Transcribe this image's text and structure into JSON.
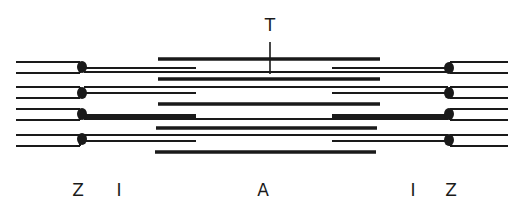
{
  "diagram": {
    "colors": {
      "line": "#1a1a1a",
      "background": "#ffffff"
    },
    "labels": {
      "top_marker": "T",
      "bottom": [
        {
          "id": "z-left",
          "text": "Z",
          "x": 78
        },
        {
          "id": "i-left",
          "text": "I",
          "x": 119
        },
        {
          "id": "a-band",
          "text": "A",
          "x": 263
        },
        {
          "id": "i-right",
          "text": "I",
          "x": 413
        },
        {
          "id": "z-right",
          "text": "Z",
          "x": 451
        }
      ]
    },
    "thick_filaments": [
      {
        "x1": 158,
        "x2": 380,
        "y": 59
      },
      {
        "x1": 158,
        "x2": 380,
        "y": 79
      },
      {
        "x1": 158,
        "x2": 380,
        "y": 104
      },
      {
        "x1": 156,
        "x2": 377,
        "y": 128
      },
      {
        "x1": 155,
        "x2": 376,
        "y": 152
      }
    ],
    "z_discs": {
      "left_x": 81,
      "right_x": 448,
      "y": [
        68,
        93,
        115,
        140
      ]
    }
  }
}
